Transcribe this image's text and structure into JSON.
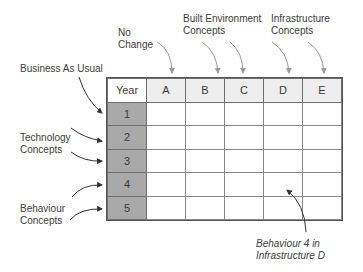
{
  "labels": {
    "no_change_line1": "No",
    "no_change_line2": "Change",
    "built_env_line1": "Built Environment",
    "built_env_line2": "Concepts",
    "infra_line1": "Infrastructure",
    "infra_line2": "Concepts",
    "business_as_usual": "Business As Usual",
    "technology_line1": "Technology",
    "technology_line2": "Concepts",
    "behaviour_line1": "Behaviour",
    "behaviour_line2": "Concepts",
    "annotation_line1": "Behaviour 4  in",
    "annotation_line2": "Infrastructure D"
  },
  "table": {
    "corner": "Year",
    "columns": [
      "A",
      "B",
      "C",
      "D",
      "E"
    ],
    "rows": [
      "1",
      "2",
      "3",
      "4",
      "5"
    ]
  },
  "colors": {
    "year_column_fill": "#a9a9a9",
    "header_fill": "#eeeeee",
    "arrow_light": "#9a9a9a",
    "arrow_dark": "#333333"
  }
}
